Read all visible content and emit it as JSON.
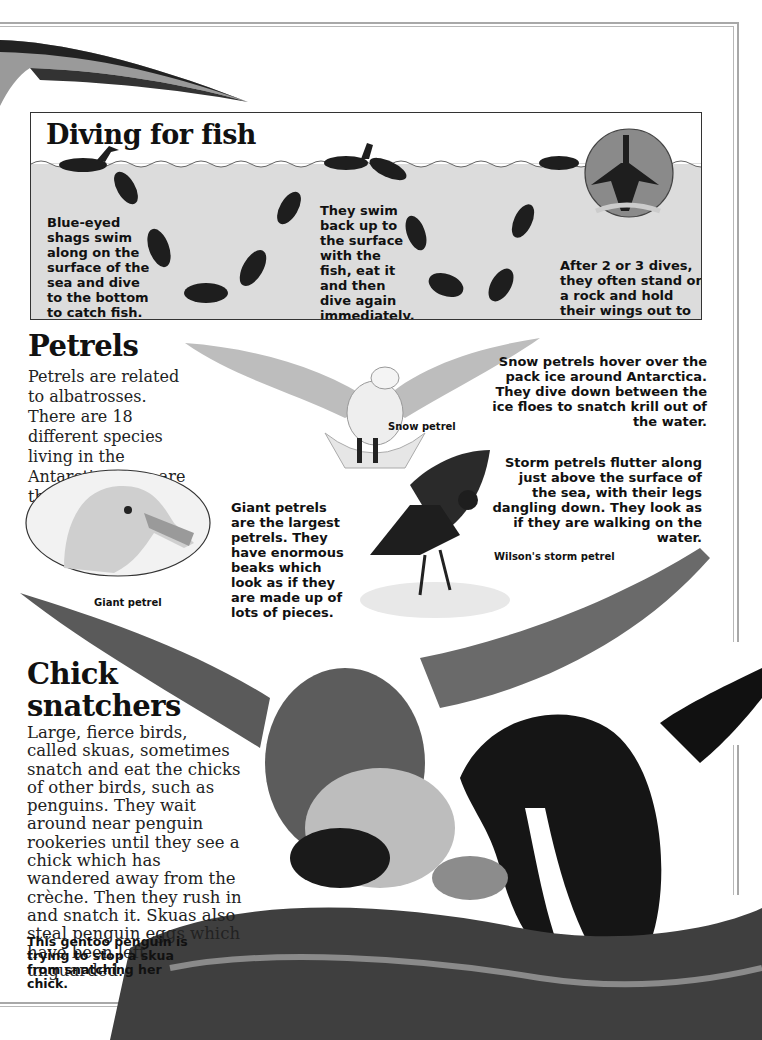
{
  "diving": {
    "title": "Diving for fish",
    "text_left": "Blue-eyed shags swim along on the surface of the sea and dive to the bottom to catch fish.",
    "text_middle": "They swim back up to the surface with the fish, eat it and then dive again immediately.",
    "text_right": "After 2 or 3 dives, they often stand on a rock and hold their wings out to dry."
  },
  "petrels": {
    "title": "Petrels",
    "intro": "Petrels are related to albatrosses. There are 18 different species living in the Antarctic. Here are three of them.",
    "snow_text": "Snow petrels hover over the pack ice around Antarctica. They dive down between the ice floes to snatch krill out of the water.",
    "snow_caption": "Snow petrel",
    "giant_text": "Giant petrels are the largest petrels. They have enormous beaks which look as if they are made up of lots of pieces.",
    "giant_caption": "Giant petrel",
    "storm_text": "Storm petrels flutter along just above the surface of the sea, with their legs dangling down. They look as if they are walking on the water.",
    "storm_caption": "Wilson's storm petrel"
  },
  "chick": {
    "title_line1": "Chick",
    "title_line2": "snatchers",
    "body": "Large, fierce birds, called skuas, sometimes snatch and eat the chicks of other birds, such as penguins. They wait around near penguin rookeries until they see a chick which has wandered away from the crèche. Then they rush in and snatch it. Skuas also steal penguin eggs which have been left unguarded.",
    "caption": "This gentoo penguin is trying to stop a skua from snatching her chick."
  },
  "colors": {
    "water": "#dcdcdc",
    "frame": "#a8a8a8",
    "ink": "#111111"
  }
}
